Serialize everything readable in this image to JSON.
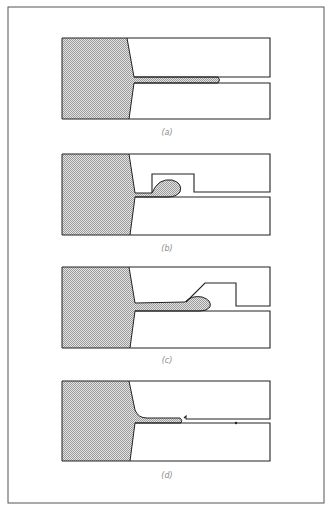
{
  "figure": {
    "frame_color": "#555555",
    "fill_color": "#c8c8c8",
    "stroke_color": "#222222",
    "panels": [
      {
        "id": "a",
        "label": "(a)"
      },
      {
        "id": "b",
        "label": "(b)"
      },
      {
        "id": "c",
        "label": "(c)"
      },
      {
        "id": "d",
        "label": "(d)"
      }
    ]
  }
}
